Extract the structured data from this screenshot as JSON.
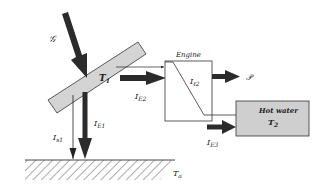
{
  "diagram": {
    "labels": {
      "irradiance": "𝒢",
      "collector_temp": "T",
      "collector_temp_sub": "1",
      "engine": "Engine",
      "engine_internal": "I",
      "engine_internal_sub": "ℓ2",
      "power": "𝒫",
      "hot_water": "Hot water",
      "hot_water_temp": "T",
      "hot_water_temp_sub": "2",
      "ambient_temp": "T",
      "ambient_temp_sub": "a",
      "loss_s1": "I",
      "loss_s1_sub": "s1",
      "loss_e1": "I",
      "loss_e1_sub": "E1",
      "loss_e2": "I",
      "loss_e2_sub": "E2",
      "loss_e3": "I",
      "loss_e3_sub": "E3"
    },
    "colors": {
      "arrow_fill": "#2b2b2b",
      "collector_fill": "#d4d4d4",
      "hot_water_fill": "#cfcfcf",
      "line": "#333333"
    }
  }
}
